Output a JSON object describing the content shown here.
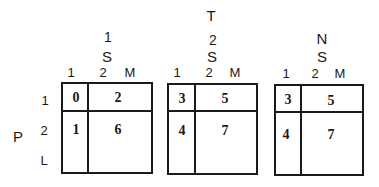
{
  "diagram": {
    "top_label": "T",
    "row_axis": {
      "label": "P",
      "levels": [
        "1",
        "2",
        "L"
      ]
    },
    "panels": [
      {
        "header": [
          "1",
          "S"
        ],
        "columns": [
          "1",
          "2",
          "M"
        ],
        "cells": {
          "r1c1": "0",
          "r1c2": "2",
          "r2c1": "1",
          "r2c2": "6"
        }
      },
      {
        "header": [
          "2",
          "S"
        ],
        "columns": [
          "1",
          "2",
          "M"
        ],
        "cells": {
          "r1c1": "3",
          "r1c2": "5",
          "r2c1": "4",
          "r2c2": "7"
        }
      },
      {
        "header": [
          "N",
          "S"
        ],
        "columns": [
          "1",
          "2",
          "M"
        ],
        "cells": {
          "r1c1": "3",
          "r1c2": "5",
          "r2c1": "4",
          "r2c2": "7"
        }
      }
    ]
  }
}
